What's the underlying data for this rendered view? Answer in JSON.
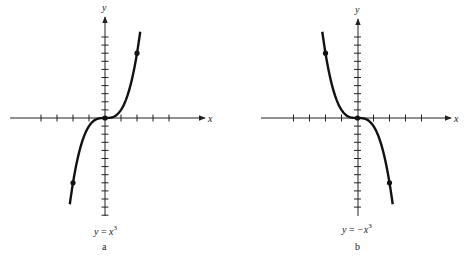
{
  "chart_data": [
    {
      "type": "line",
      "panel": "a",
      "caption": "y = x³",
      "caption_parts": {
        "lhs": "y",
        "eq": " = ",
        "rhs": "x",
        "exp": "3"
      },
      "panel_label": "a",
      "xlabel": "x",
      "ylabel": "y",
      "function": "y = x^3",
      "x": [
        -2.2,
        -2,
        -1.5,
        -1,
        -0.5,
        0,
        0.5,
        1,
        1.5,
        2,
        2.2
      ],
      "y": [
        -10.648,
        -8,
        -3.375,
        -1,
        -0.125,
        0,
        0.125,
        1,
        3.375,
        8,
        10.648
      ],
      "marked_points": [
        [
          -2,
          -8
        ],
        [
          0,
          0
        ],
        [
          2,
          8
        ]
      ],
      "x_ticks": [
        -4,
        -3,
        -2,
        -1,
        1,
        2,
        3,
        4
      ],
      "y_ticks": [
        -12,
        -11,
        -10,
        -9,
        -8,
        -7,
        -6,
        -5,
        -4,
        -3,
        -2,
        -1,
        1,
        2,
        3,
        4,
        5,
        6,
        7,
        8,
        9,
        10
      ],
      "xlim": [
        -6,
        6.3
      ],
      "ylim": [
        -12,
        12.4
      ],
      "grid": false,
      "tick_labels": false
    },
    {
      "type": "line",
      "panel": "b",
      "caption": "y = −x³",
      "caption_parts": {
        "lhs": "y",
        "eq": " = ",
        "rhs": "−x",
        "exp": "3"
      },
      "panel_label": "b",
      "xlabel": "x",
      "ylabel": "y",
      "function": "y = -x^3",
      "x": [
        -2.2,
        -2,
        -1.5,
        -1,
        -0.5,
        0,
        0.5,
        1,
        1.5,
        2,
        2.2
      ],
      "y": [
        10.648,
        8,
        3.375,
        1,
        0.125,
        0,
        -0.125,
        -1,
        -3.375,
        -8,
        -10.648
      ],
      "marked_points": [
        [
          -2,
          8
        ],
        [
          0,
          0
        ],
        [
          2,
          -8
        ]
      ],
      "x_ticks": [
        -4,
        -3,
        -2,
        -1,
        1,
        2,
        3,
        4
      ],
      "y_ticks": [
        -11,
        -10,
        -9,
        -8,
        -7,
        -6,
        -5,
        -4,
        -3,
        -2,
        -1,
        1,
        2,
        3,
        4,
        5,
        6,
        7,
        8,
        9,
        10
      ],
      "xlim": [
        -6,
        6
      ],
      "ylim": [
        -12,
        12.2
      ],
      "grid": false,
      "tick_labels": false
    }
  ],
  "panels": {
    "a": {
      "xlabel": "x",
      "ylabel": "y",
      "cap_lhs": "y",
      "cap_eq": " = ",
      "cap_rhs": "x",
      "cap_exp": "3",
      "label": "a"
    },
    "b": {
      "xlabel": "x",
      "ylabel": "y",
      "cap_lhs": "y",
      "cap_eq": " = ",
      "cap_rhs": "−x",
      "cap_exp": "3",
      "label": "b"
    }
  },
  "style": {
    "ink": "#111111",
    "background": "#ffffff"
  }
}
